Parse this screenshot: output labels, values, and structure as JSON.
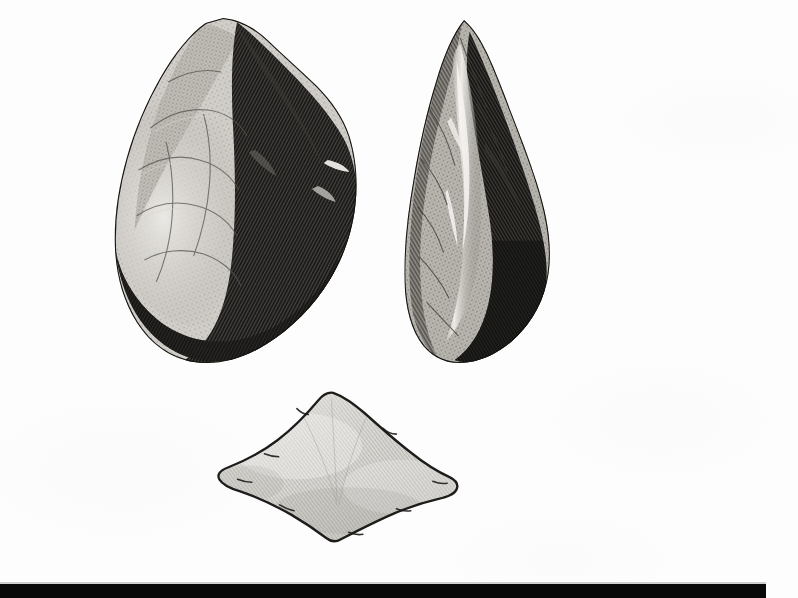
{
  "plate": {
    "medium": "wood-engraving halftone scan",
    "background_color": "#fdfdfd",
    "width": 798,
    "height": 598,
    "subject": "Three chipped flint implements",
    "caption": "",
    "figure_number": ""
  },
  "figures": [
    {
      "id": "biface-face",
      "name": "ovate-handaxe-face-view",
      "description": "Pear-shaped bifacial flint handaxe, face view, light flaked left side and heavily shaded dark right side with rounded butt",
      "bounds": {
        "x": 115,
        "y": 18,
        "width": 250,
        "height": 352
      },
      "tone_light": "#c9c7c2",
      "tone_mid": "#7d7a75",
      "tone_dark": "#161513",
      "outline_color": "#101010"
    },
    {
      "id": "biface-edge",
      "name": "ovate-handaxe-edge-view",
      "description": "Same handaxe seen edge-on, pointed apex, bright central ridge, dark shaded lower right mass",
      "bounds": {
        "x": 403,
        "y": 20,
        "width": 152,
        "height": 350
      },
      "tone_light": "#dcdad5",
      "tone_mid": "#6f6c67",
      "tone_dark": "#111110",
      "outline_color": "#101010"
    },
    {
      "id": "flake",
      "name": "flint-flake-blade",
      "description": "Low flat lozenge-shaped flint flake with fine diagonal hatching, pale grey, dark outline",
      "bounds": {
        "x": 213,
        "y": 393,
        "width": 252,
        "height": 149
      },
      "tone_light": "#dedcd8",
      "tone_mid": "#c2c0bb",
      "tone_dark": "#9e9c97",
      "outline_color": "#1a1a18"
    }
  ],
  "footer": {
    "name": "page-edge-black-bar",
    "color": "#080808",
    "bounds": {
      "x": 0,
      "y": 584,
      "width": 766,
      "height": 14
    }
  }
}
